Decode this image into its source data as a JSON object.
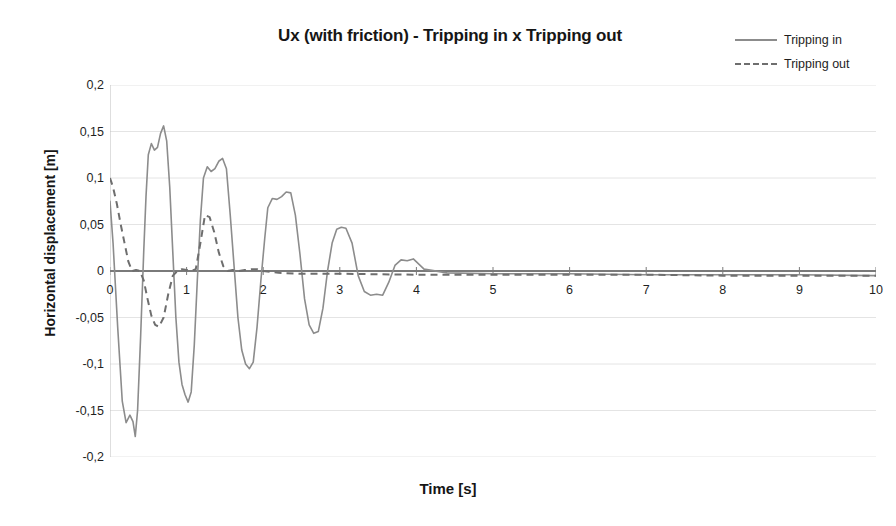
{
  "chart_data": {
    "type": "line",
    "title": "Ux (with friction) - Tripping in x Tripping out",
    "xlabel": "Time [s]",
    "ylabel": "Horizontal displacement [m]",
    "xlim": [
      0,
      10
    ],
    "ylim": [
      -0.2,
      0.2
    ],
    "grid": true,
    "grid_axis": "y",
    "legend_position": "top-right",
    "xticks": [
      "0",
      "1",
      "2",
      "3",
      "4",
      "5",
      "6",
      "7",
      "8",
      "9",
      "10"
    ],
    "xtick_values": [
      0,
      1,
      2,
      3,
      4,
      5,
      6,
      7,
      8,
      9,
      10
    ],
    "yticks": [
      "0,2",
      "0,15",
      "0,1",
      "0,05",
      "0",
      "-0,05",
      "-0,1",
      "-0,15",
      "-0,2"
    ],
    "ytick_values": [
      0.2,
      0.15,
      0.1,
      0.05,
      0,
      -0.05,
      -0.1,
      -0.15,
      -0.2
    ],
    "series": [
      {
        "name": "Tripping in",
        "style": "solid",
        "color": "#8c8c8c",
        "x": [
          0.0,
          0.04,
          0.1,
          0.16,
          0.21,
          0.26,
          0.3,
          0.33,
          0.36,
          0.4,
          0.44,
          0.47,
          0.5,
          0.54,
          0.58,
          0.62,
          0.66,
          0.7,
          0.74,
          0.78,
          0.82,
          0.86,
          0.9,
          0.94,
          0.98,
          1.02,
          1.06,
          1.1,
          1.14,
          1.18,
          1.22,
          1.27,
          1.32,
          1.37,
          1.42,
          1.47,
          1.52,
          1.57,
          1.62,
          1.67,
          1.72,
          1.77,
          1.82,
          1.87,
          1.92,
          1.97,
          2.02,
          2.06,
          2.12,
          2.18,
          2.24,
          2.3,
          2.36,
          2.42,
          2.48,
          2.54,
          2.6,
          2.66,
          2.72,
          2.78,
          2.84,
          2.9,
          2.96,
          3.02,
          3.08,
          3.16,
          3.24,
          3.32,
          3.4,
          3.48,
          3.56,
          3.64,
          3.72,
          3.8,
          3.88,
          3.96,
          4.1,
          4.4,
          5.0,
          6.0,
          7.0,
          8.0,
          9.0,
          10.0
        ],
        "y": [
          0.075,
          0.03,
          -0.06,
          -0.14,
          -0.163,
          -0.155,
          -0.162,
          -0.178,
          -0.15,
          -0.07,
          0.02,
          0.08,
          0.125,
          0.137,
          0.13,
          0.133,
          0.148,
          0.156,
          0.14,
          0.09,
          0.02,
          -0.05,
          -0.098,
          -0.122,
          -0.133,
          -0.141,
          -0.13,
          -0.08,
          -0.01,
          0.055,
          0.1,
          0.112,
          0.107,
          0.11,
          0.118,
          0.121,
          0.11,
          0.06,
          0.005,
          -0.05,
          -0.085,
          -0.1,
          -0.105,
          -0.098,
          -0.06,
          -0.01,
          0.035,
          0.068,
          0.078,
          0.077,
          0.08,
          0.085,
          0.084,
          0.06,
          0.018,
          -0.03,
          -0.058,
          -0.067,
          -0.065,
          -0.04,
          0.0,
          0.03,
          0.045,
          0.047,
          0.046,
          0.03,
          -0.005,
          -0.022,
          -0.026,
          -0.025,
          -0.026,
          -0.012,
          0.006,
          0.012,
          0.011,
          0.013,
          0.002,
          -0.002,
          -0.003,
          -0.003,
          -0.004,
          -0.004,
          -0.004,
          -0.005
        ]
      },
      {
        "name": "Tripping out",
        "style": "dashed",
        "color": "#6e6e6e",
        "x": [
          0.0,
          0.04,
          0.09,
          0.14,
          0.19,
          0.24,
          0.29,
          0.34,
          0.39,
          0.44,
          0.49,
          0.54,
          0.59,
          0.64,
          0.7,
          0.76,
          0.82,
          0.88,
          0.94,
          1.0,
          1.06,
          1.12,
          1.18,
          1.24,
          1.3,
          1.36,
          1.42,
          1.48,
          1.54,
          1.6,
          1.68,
          1.76,
          1.84,
          1.92,
          2.0,
          2.2,
          2.5,
          3.0,
          4.0,
          5.0,
          6.0,
          7.0,
          8.0,
          9.0,
          10.0
        ],
        "y": [
          0.1,
          0.09,
          0.072,
          0.05,
          0.03,
          0.01,
          0.0,
          0.001,
          0.0,
          -0.01,
          -0.03,
          -0.048,
          -0.058,
          -0.06,
          -0.05,
          -0.025,
          -0.005,
          0.0,
          0.002,
          0.001,
          0.0,
          0.002,
          0.03,
          0.06,
          0.058,
          0.042,
          0.02,
          0.005,
          0.0,
          0.001,
          0.0,
          0.001,
          0.002,
          0.002,
          0.0,
          -0.002,
          -0.003,
          -0.003,
          -0.004,
          -0.004,
          -0.004,
          -0.004,
          -0.005,
          -0.005,
          -0.005
        ]
      }
    ]
  },
  "legend": {
    "items": [
      {
        "label": "Tripping in"
      },
      {
        "label": "Tripping out"
      }
    ]
  }
}
